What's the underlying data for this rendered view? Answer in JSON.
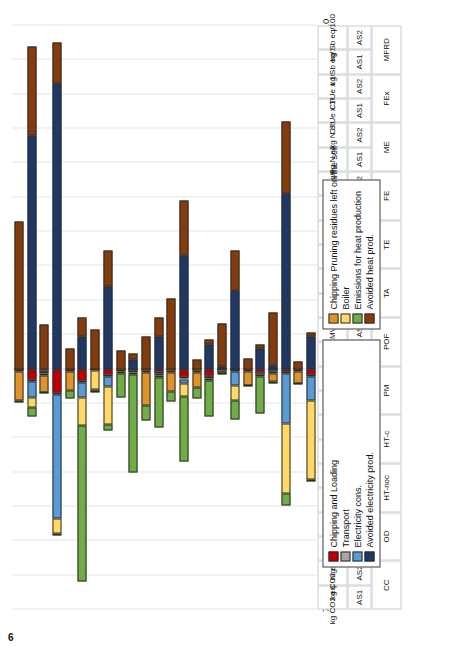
{
  "page": {
    "number": "6"
  },
  "chart_data": {
    "type": "bar",
    "orientation": "horizontal-stacked",
    "title": "",
    "xlabel": "Impact Score",
    "ylabel": "",
    "grid": true,
    "xlim": [
      7,
      -10
    ],
    "xticks": [
      7,
      6,
      5,
      4,
      3,
      2,
      1,
      0,
      -1,
      -2,
      -3,
      -4,
      -5,
      -6,
      -7,
      -8,
      -9,
      -10
    ],
    "xticklabels": [
      "7",
      "6",
      "5",
      "4",
      "3",
      "2",
      "1",
      "0",
      "-1",
      "-2",
      "-3",
      "-4",
      "-5",
      "-6",
      "-7",
      "-8",
      "-9",
      "-10"
    ],
    "legend_position": "inside-upper",
    "series": [
      {
        "name": "Chipping and Loading",
        "color": "#C00000"
      },
      {
        "name": "Transport",
        "color": "#A6A6A6"
      },
      {
        "name": "Electricity cons.",
        "color": "#5B9BD5"
      },
      {
        "name": "Avoided electricity prod.",
        "color": "#1F3864"
      },
      {
        "name": "Chipping Pruning residues left on the soil",
        "color": "#E1932B"
      },
      {
        "name": "Boiler",
        "color": "#FFD966"
      },
      {
        "name": "Emissions for heat production",
        "color": "#70AD47"
      },
      {
        "name": "Avoided heat prod.",
        "color": "#843C0C"
      }
    ],
    "categories": [
      {
        "impact": "CC",
        "scenario": "AS1",
        "unit": "kg CO2 eq/100"
      },
      {
        "impact": "CC",
        "scenario": "AS2",
        "unit": "kg CO2 eq/100"
      },
      {
        "impact": "OD",
        "scenario": "AS1",
        "unit": "mg CFC-11 eq/10"
      },
      {
        "impact": "OD",
        "scenario": "AS2",
        "unit": "mg CFC-11 eq/10"
      },
      {
        "impact": "HT-noc",
        "scenario": "AS1",
        "unit": "CTUh/10000"
      },
      {
        "impact": "HT-noc",
        "scenario": "AS2",
        "unit": "CTUh/10000"
      },
      {
        "impact": "HT-c",
        "scenario": "AS1",
        "unit": "CTUh/100000"
      },
      {
        "impact": "HT-c",
        "scenario": "AS2",
        "unit": "CTUh/100000"
      },
      {
        "impact": "PM",
        "scenario": "AS1",
        "unit": "kg PM2.5 eq"
      },
      {
        "impact": "PM",
        "scenario": "AS2",
        "unit": "kg PM2.5 eq"
      },
      {
        "impact": "POF",
        "scenario": "AS1",
        "unit": "kg NMVOC eq"
      },
      {
        "impact": "POF",
        "scenario": "AS2",
        "unit": "kg NMVOC eq"
      },
      {
        "impact": "TA",
        "scenario": "AS1",
        "unit": "molc H+ eq"
      },
      {
        "impact": "TA",
        "scenario": "AS2",
        "unit": "molc H+ eq"
      },
      {
        "impact": "TE",
        "scenario": "AS1",
        "unit": "molc N eq x 10"
      },
      {
        "impact": "TE",
        "scenario": "AS2",
        "unit": "molc N eq x 10"
      },
      {
        "impact": "FE",
        "scenario": "AS1",
        "unit": "kg P eq/10"
      },
      {
        "impact": "FE",
        "scenario": "AS2",
        "unit": "kg P eq/10"
      },
      {
        "impact": "ME",
        "scenario": "AS1",
        "unit": "kg N eq"
      },
      {
        "impact": "ME",
        "scenario": "AS2",
        "unit": "kg N eq"
      },
      {
        "impact": "FEx",
        "scenario": "AS1",
        "unit": "CTUe x 1000"
      },
      {
        "impact": "FEx",
        "scenario": "AS2",
        "unit": "CTUe x 1000"
      },
      {
        "impact": "MFRD",
        "scenario": "AS1",
        "unit": "kg Sb eq/100"
      },
      {
        "impact": "MFRD",
        "scenario": "AS2",
        "unit": "kg Sb eq/100"
      }
    ],
    "values": [
      {
        "Chipping and Loading": 0.05,
        "Transport": 0.02,
        "Electricity cons.": 0.0,
        "Avoided electricity prod.": 0.0,
        "Chipping Pruning residues left on the soil": 0.85,
        "Boiler": 0.0,
        "Emissions for heat production": 0.05,
        "Avoided heat prod.": -4.3
      },
      {
        "Chipping and Loading": 0.32,
        "Transport": 0.05,
        "Electricity cons.": 0.45,
        "Avoided electricity prod.": -6.8,
        "Chipping Pruning residues left on the soil": 0.0,
        "Boiler": 0.3,
        "Emissions for heat production": 0.25,
        "Avoided heat prod.": -2.6
      },
      {
        "Chipping and Loading": 0.06,
        "Transport": 0.05,
        "Electricity cons.": 0.02,
        "Avoided electricity prod.": 0.0,
        "Chipping Pruning residues left on the soil": 0.5,
        "Boiler": 0.05,
        "Emissions for heat production": 0.03,
        "Avoided heat prod.": -1.3
      },
      {
        "Chipping and Loading": 0.7,
        "Transport": 0.05,
        "Electricity cons.": 3.6,
        "Avoided electricity prod.": -8.3,
        "Chipping Pruning residues left on the soil": 0.0,
        "Boiler": 0.45,
        "Emissions for heat production": 0.05,
        "Avoided heat prod.": -1.2
      },
      {
        "Chipping and Loading": 0.05,
        "Transport": 0.02,
        "Electricity cons.": 0.0,
        "Avoided electricity prod.": 0.0,
        "Chipping Pruning residues left on the soil": 0.55,
        "Boiler": 0.0,
        "Emissions for heat production": 0.25,
        "Avoided heat prod.": -0.6
      },
      {
        "Chipping and Loading": 0.35,
        "Transport": 0.04,
        "Electricity cons.": 0.45,
        "Avoided electricity prod.": -0.95,
        "Chipping Pruning residues left on the soil": 0.0,
        "Boiler": 0.8,
        "Emissions for heat production": 4.55,
        "Avoided heat prod.": -0.55
      },
      {
        "Chipping and Loading": 0.03,
        "Transport": 0.02,
        "Electricity cons.": 0.0,
        "Avoided electricity prod.": 0.0,
        "Chipping Pruning residues left on the soil": 0.05,
        "Boiler": 0.55,
        "Emissions for heat production": 0.03,
        "Avoided heat prod.": -1.15
      },
      {
        "Chipping and Loading": 0.18,
        "Transport": 0.03,
        "Electricity cons.": 0.3,
        "Avoided electricity prod.": -2.4,
        "Chipping Pruning residues left on the soil": 0.0,
        "Boiler": 1.1,
        "Emissions for heat production": 0.18,
        "Avoided heat prod.": -1.05
      },
      {
        "Chipping and Loading": 0.03,
        "Transport": 0.02,
        "Electricity cons.": 0.0,
        "Avoided electricity prod.": 0.0,
        "Chipping Pruning residues left on the soil": 0.05,
        "Boiler": 0.03,
        "Emissions for heat production": 0.7,
        "Avoided heat prod.": -0.55
      },
      {
        "Chipping and Loading": 0.05,
        "Transport": 0.03,
        "Electricity cons.": 0.02,
        "Avoided electricity prod.": -0.28,
        "Chipping Pruning residues left on the soil": 0.0,
        "Boiler": 0.05,
        "Emissions for heat production": 2.85,
        "Avoided heat prod.": -0.18
      },
      {
        "Chipping and Loading": 0.05,
        "Transport": 0.03,
        "Electricity cons.": 0.0,
        "Avoided electricity prod.": 0.0,
        "Chipping Pruning residues left on the soil": 0.95,
        "Boiler": 0.02,
        "Emissions for heat production": 0.45,
        "Avoided heat prod.": -0.95
      },
      {
        "Chipping and Loading": 0.1,
        "Transport": 0.03,
        "Electricity cons.": 0.05,
        "Avoided electricity prod.": -0.95,
        "Chipping Pruning residues left on the soil": 0.0,
        "Boiler": 0.08,
        "Emissions for heat production": 1.45,
        "Avoided heat prod.": -0.55
      },
      {
        "Chipping and Loading": 0.05,
        "Transport": 0.02,
        "Electricity cons.": 0.0,
        "Avoided electricity prod.": 0.0,
        "Chipping Pruning residues left on the soil": 0.55,
        "Boiler": 0.02,
        "Emissions for heat production": 0.3,
        "Avoided heat prod.": -2.05
      },
      {
        "Chipping and Loading": 0.25,
        "Transport": 0.04,
        "Electricity cons.": 0.12,
        "Avoided electricity prod.": -3.3,
        "Chipping Pruning residues left on the soil": 0.0,
        "Boiler": 0.38,
        "Emissions for heat production": 1.9,
        "Avoided heat prod.": -1.6
      },
      {
        "Chipping and Loading": 0.05,
        "Transport": 0.02,
        "Electricity cons.": 0.0,
        "Avoided electricity prod.": 0.0,
        "Chipping Pruning residues left on the soil": 0.45,
        "Boiler": 0.02,
        "Emissions for heat production": 0.32,
        "Avoided heat prod.": -0.28
      },
      {
        "Chipping and Loading": 0.22,
        "Transport": 0.03,
        "Electricity cons.": 0.03,
        "Avoided electricity prod.": -0.7,
        "Chipping Pruning residues left on the soil": 0.0,
        "Boiler": 0.05,
        "Emissions for heat production": 1.05,
        "Avoided heat prod.": -0.15
      },
      {
        "Chipping and Loading": 0.03,
        "Transport": 0.02,
        "Electricity cons.": 0.02,
        "Avoided electricity prod.": -0.08,
        "Chipping Pruning residues left on the soil": 0.05,
        "Boiler": 0.02,
        "Emissions for heat production": 0.03,
        "Avoided heat prod.": -1.25
      },
      {
        "Chipping and Loading": 0.05,
        "Transport": 0.02,
        "Electricity cons.": 0.4,
        "Avoided electricity prod.": -2.3,
        "Chipping Pruning residues left on the soil": 0.0,
        "Boiler": 0.45,
        "Emissions for heat production": 0.55,
        "Avoided heat prod.": -1.15
      },
      {
        "Chipping and Loading": 0.03,
        "Transport": 0.02,
        "Electricity cons.": 0.0,
        "Avoided electricity prod.": 0.0,
        "Chipping Pruning residues left on the soil": 0.42,
        "Boiler": 0.02,
        "Emissions for heat production": 0.03,
        "Avoided heat prod.": -0.3
      },
      {
        "Chipping and Loading": 0.12,
        "Transport": 0.03,
        "Electricity cons.": 0.03,
        "Avoided electricity prod.": -0.6,
        "Chipping Pruning residues left on the soil": 0.0,
        "Boiler": 0.05,
        "Emissions for heat production": 1.05,
        "Avoided heat prod.": -0.1
      },
      {
        "Chipping and Loading": 0.05,
        "Transport": 0.02,
        "Electricity cons.": 0.02,
        "Avoided electricity prod.": -0.1,
        "Chipping Pruning residues left on the soil": 0.22,
        "Boiler": 0.05,
        "Emissions for heat production": 0.05,
        "Avoided heat prod.": -1.55
      },
      {
        "Chipping and Loading": 0.1,
        "Transport": 0.03,
        "Electricity cons.": 1.45,
        "Avoided electricity prod.": -5.1,
        "Chipping Pruning residues left on the soil": 0.0,
        "Boiler": 2.05,
        "Emissions for heat production": 0.35,
        "Avoided heat prod.": -2.1
      },
      {
        "Chipping and Loading": 0.02,
        "Transport": 0.02,
        "Electricity cons.": 0.0,
        "Avoided electricity prod.": 0.0,
        "Chipping Pruning residues left on the soil": 0.35,
        "Boiler": 0.02,
        "Emissions for heat production": 0.03,
        "Avoided heat prod.": -0.22
      },
      {
        "Chipping and Loading": 0.18,
        "Transport": 0.03,
        "Electricity cons.": 0.7,
        "Avoided electricity prod.": -0.95,
        "Chipping Pruning residues left on the soil": 0.0,
        "Boiler": 2.3,
        "Emissions for heat production": 0.05,
        "Avoided heat prod.": -0.1
      }
    ]
  },
  "legend_a": {
    "items": [
      {
        "label": "Chipping Pruning residues left on the soil",
        "color": "#E1932B"
      },
      {
        "label": "Boiler",
        "color": "#FFD966"
      },
      {
        "label": "Emissions for heat production",
        "color": "#70AD47"
      },
      {
        "label": "Avoided heat prod.",
        "color": "#843C0C"
      }
    ]
  },
  "legend_b": {
    "items": [
      {
        "label": "Chipping and Loading",
        "color": "#C00000"
      },
      {
        "label": "Transport",
        "color": "#A6A6A6"
      },
      {
        "label": "Electricity cons.",
        "color": "#5B9BD5"
      },
      {
        "label": "Avoided electricity prod.",
        "color": "#1F3864"
      }
    ]
  }
}
